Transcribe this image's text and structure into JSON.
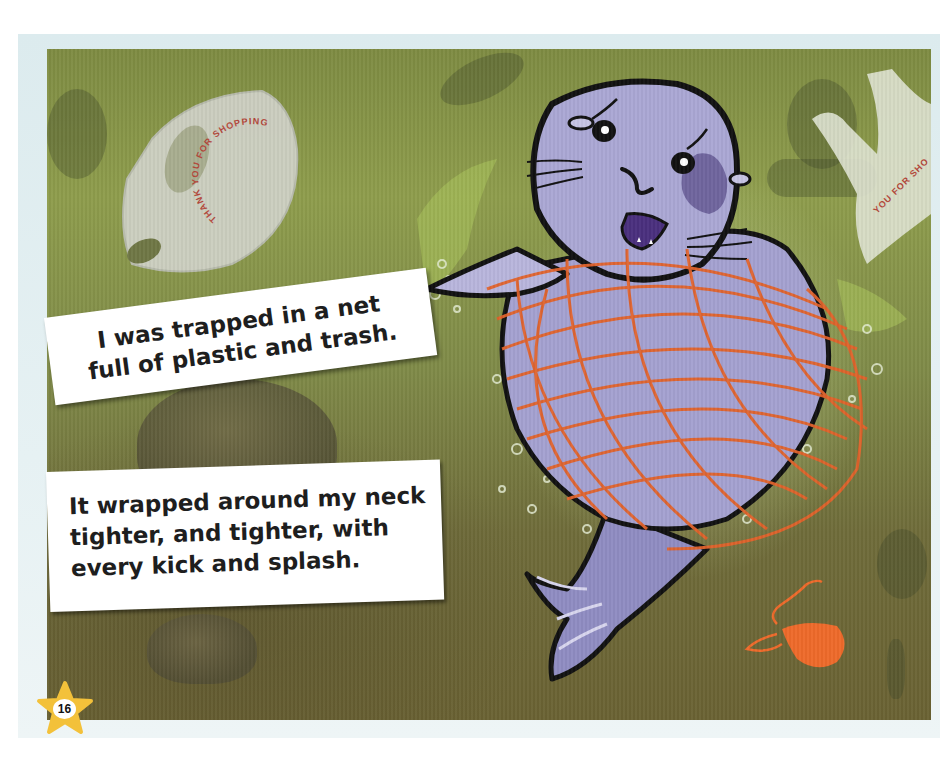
{
  "page": {
    "number": "16",
    "colors": {
      "frame": "#dcebee",
      "water_top": "#8e9d4c",
      "water_bottom": "#6a6233",
      "seal_body": "#9b98c8",
      "seal_outline": "#111111",
      "net": "#e2622a",
      "balloon": "#ee6a2a",
      "star": "#f3c13a",
      "caption_bg": "#ffffff",
      "caption_text": "#1e1e1e",
      "bag_print": "#b4473a"
    }
  },
  "captions": [
    {
      "lines": [
        "I was trapped in a net",
        "full of plastic and trash."
      ]
    },
    {
      "lines": [
        "It wrapped around my neck",
        "tighter, and tighter, with",
        "every kick and splash."
      ]
    }
  ],
  "illustration": {
    "character": "seal-tangled-in-net",
    "bags": [
      {
        "print": "THANK YOU FOR SHOPPING"
      },
      {
        "print": "YOU FOR SHO"
      }
    ],
    "objects": [
      "plastic-bag",
      "plastic-bag",
      "deflated-balloon",
      "fishing-net",
      "rocks",
      "bubbles"
    ]
  }
}
